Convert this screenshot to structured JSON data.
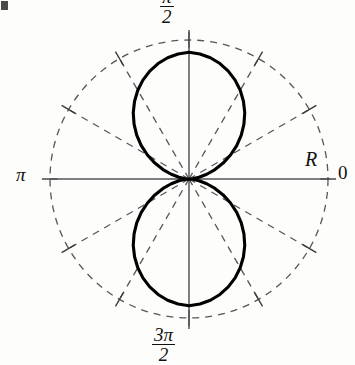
{
  "figure": {
    "kind": "polar-plot",
    "background_color": "#fdfdfb",
    "ink_color": "#111111",
    "grid_color": "#55555a",
    "axis_color": "#55555a",
    "curve_color": "#000000"
  },
  "labels": {
    "top_numerator": "π",
    "top_denominator": "2",
    "bottom_numerator": "3π",
    "bottom_denominator": "2",
    "left": "π",
    "right_angle": "0",
    "radial_axis": "R"
  },
  "chart_data": {
    "type": "line",
    "coordinate_system": "polar",
    "title": "",
    "xlabel": "",
    "ylabel": "R",
    "angle_unit": "radians",
    "angle_tick_labels": [
      "0",
      "π/2",
      "π",
      "3π/2"
    ],
    "angle_tick_values": [
      0,
      1.5708,
      3.1416,
      4.7124
    ],
    "grid": true,
    "grid_angles_deg": [
      0,
      30,
      60,
      90,
      120,
      150,
      180,
      210,
      240,
      270,
      300,
      330
    ],
    "outer_circle_radius": 1.0,
    "rlim": [
      0,
      1.0
    ],
    "legend": "none",
    "series": [
      {
        "name": "R(theta)",
        "formula": "r = |sin(theta)|^1.55",
        "theta_deg": [
          0,
          5,
          10,
          15,
          20,
          25,
          30,
          35,
          40,
          45,
          50,
          55,
          60,
          65,
          70,
          75,
          80,
          85,
          90,
          95,
          100,
          105,
          110,
          115,
          120,
          125,
          130,
          135,
          140,
          145,
          150,
          155,
          160,
          165,
          170,
          175,
          180,
          185,
          190,
          195,
          200,
          205,
          210,
          215,
          220,
          225,
          230,
          235,
          240,
          245,
          250,
          255,
          260,
          265,
          270,
          275,
          280,
          285,
          290,
          295,
          300,
          305,
          310,
          315,
          320,
          325,
          330,
          335,
          340,
          345,
          350,
          355,
          360
        ],
        "r": [
          0.0,
          0.026,
          0.073,
          0.132,
          0.199,
          0.271,
          0.345,
          0.419,
          0.491,
          0.559,
          0.624,
          0.683,
          0.737,
          0.785,
          0.826,
          0.86,
          0.886,
          0.903,
          0.912,
          0.903,
          0.886,
          0.86,
          0.826,
          0.785,
          0.737,
          0.683,
          0.624,
          0.559,
          0.491,
          0.419,
          0.345,
          0.271,
          0.199,
          0.132,
          0.073,
          0.026,
          0.0,
          0.026,
          0.073,
          0.132,
          0.199,
          0.271,
          0.345,
          0.419,
          0.491,
          0.559,
          0.624,
          0.683,
          0.737,
          0.785,
          0.826,
          0.86,
          0.886,
          0.903,
          0.912,
          0.903,
          0.886,
          0.86,
          0.826,
          0.785,
          0.737,
          0.683,
          0.624,
          0.559,
          0.491,
          0.419,
          0.345,
          0.271,
          0.199,
          0.132,
          0.073,
          0.026,
          0.0
        ]
      }
    ],
    "annotations": [
      {
        "text": "R",
        "position": "right-axis-end"
      },
      {
        "text": "0",
        "position": "angle-0"
      },
      {
        "text": "π",
        "position": "angle-pi"
      },
      {
        "text": "π/2",
        "position": "angle-pi-over-2"
      },
      {
        "text": "3π/2",
        "position": "angle-3pi-over-2"
      }
    ]
  }
}
